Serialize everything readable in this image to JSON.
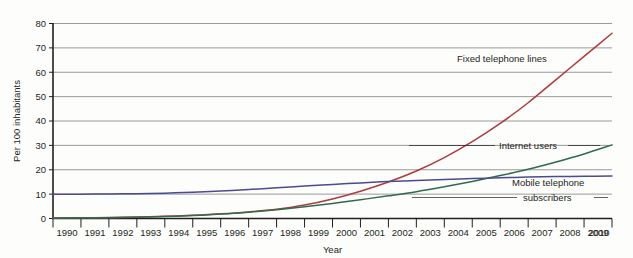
{
  "chart_data": {
    "type": "line",
    "title": "",
    "xlabel": "Year",
    "ylabel": "Per 100 inhabitants",
    "x": [
      1990,
      1991,
      1992,
      1993,
      1994,
      1995,
      1996,
      1997,
      1998,
      1999,
      2000,
      2001,
      2002,
      2003,
      2004,
      2005,
      2006,
      2007,
      2008,
      2009,
      2010
    ],
    "xtick_labels": [
      "1990",
      "1991",
      "1992",
      "1993",
      "1994",
      "1995",
      "1996",
      "1997",
      "1998",
      "1999",
      "2000",
      "2001",
      "2002",
      "2003",
      "2004",
      "2005",
      "2006",
      "2007",
      "2008",
      "2009",
      "2010"
    ],
    "ytick_labels": [
      "0",
      "10",
      "20",
      "30",
      "40",
      "50",
      "60",
      "70",
      "80"
    ],
    "yticks": [
      0,
      10,
      20,
      30,
      40,
      50,
      60,
      70,
      80
    ],
    "ylim": [
      0,
      80
    ],
    "xlim": [
      1990,
      2010
    ],
    "grid": "horizontal",
    "legend_position": "inline-right-annotations",
    "series": [
      {
        "name": "Fixed telephone lines",
        "color": "#b0393c",
        "values": [
          0.2,
          0.3,
          0.4,
          0.6,
          0.9,
          1.3,
          1.9,
          2.7,
          3.8,
          5.5,
          8.0,
          11.2,
          15.0,
          19.5,
          25.0,
          31.5,
          39.0,
          47.5,
          57.0,
          66.5,
          76.0
        ]
      },
      {
        "name": "Internet users",
        "color": "#2e6b4f",
        "values": [
          0.1,
          0.2,
          0.3,
          0.5,
          0.8,
          1.2,
          1.8,
          2.6,
          3.6,
          4.8,
          6.2,
          7.7,
          9.3,
          11.0,
          13.0,
          15.2,
          17.6,
          20.2,
          23.2,
          26.5,
          30.2
        ]
      },
      {
        "name": "Mobile telephone subscribers",
        "color": "#4b4b8f",
        "values": [
          9.9,
          10.0,
          10.1,
          10.2,
          10.4,
          10.8,
          11.3,
          11.9,
          12.6,
          13.3,
          14.0,
          14.6,
          15.2,
          15.6,
          16.0,
          16.4,
          16.7,
          17.0,
          17.2,
          17.3,
          17.4
        ]
      }
    ],
    "annotations": [
      {
        "text": "Fixed telephone lines",
        "series": "Fixed telephone lines"
      },
      {
        "text": "Internet users",
        "series": "Internet users"
      },
      {
        "text": "Mobile telephone",
        "series": "Mobile telephone subscribers"
      },
      {
        "text": "subscribers",
        "series": "Mobile telephone subscribers"
      }
    ]
  }
}
